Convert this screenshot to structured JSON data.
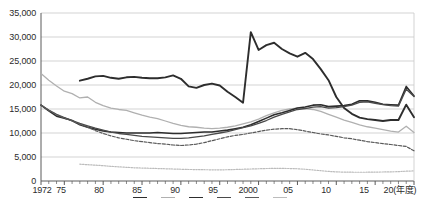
{
  "chart_data": {
    "type": "line",
    "title": "",
    "xlabel": "(年度)",
    "ylabel": "",
    "ylim": [
      0,
      35000
    ],
    "xlim": [
      1972,
      2020
    ],
    "grid": true,
    "legend_position": "bottom",
    "y_ticks": [
      "0",
      "5,000",
      "10,000",
      "15,000",
      "20,000",
      "25,000",
      "30,000",
      "35,000"
    ],
    "y_tick_values": [
      0,
      5000,
      10000,
      15000,
      20000,
      25000,
      30000,
      35000
    ],
    "x_ticks": [
      "1972",
      "75",
      "80",
      "85",
      "90",
      "95",
      "2000",
      "05",
      "10",
      "15",
      "20"
    ],
    "x_tick_values": [
      1972,
      1975,
      1980,
      1985,
      1990,
      1995,
      2000,
      2005,
      2010,
      2015,
      2020
    ],
    "x_axis_unit_label": "(年度)",
    "series": [
      {
        "name": "series-thick-dark",
        "color": "#2d2d2d",
        "style": "solid",
        "width": 1.9,
        "x": [
          1977,
          1978,
          1979,
          1980,
          1981,
          1982,
          1983,
          1984,
          1985,
          1986,
          1987,
          1988,
          1989,
          1990,
          1991,
          1992,
          1993,
          1994,
          1995,
          1996,
          1997,
          1998,
          1999,
          2000,
          2001,
          2002,
          2003,
          2004,
          2005,
          2006,
          2007,
          2008,
          2009,
          2010,
          2011,
          2012,
          2013,
          2014,
          2015,
          2016,
          2017,
          2018,
          2019,
          2020
        ],
        "values": [
          20900,
          21300,
          21800,
          21900,
          21500,
          21300,
          21600,
          21700,
          21500,
          21400,
          21400,
          21600,
          22000,
          21300,
          19700,
          19400,
          20000,
          20300,
          19900,
          18600,
          17500,
          16300,
          31000,
          27300,
          28300,
          28800,
          27500,
          26600,
          25900,
          26700,
          25400,
          23300,
          21000,
          17500,
          15200,
          14000,
          13200,
          12900,
          12700,
          12500,
          12700,
          12700,
          15900,
          13300
        ]
      },
      {
        "name": "series-light-gray",
        "color": "#b0b0b0",
        "style": "solid",
        "width": 1.3,
        "x": [
          1972,
          1973,
          1974,
          1975,
          1976,
          1977,
          1978,
          1979,
          1980,
          1981,
          1982,
          1983,
          1984,
          1985,
          1986,
          1987,
          1988,
          1989,
          1990,
          1991,
          1992,
          1993,
          1994,
          1995,
          1996,
          1997,
          1998,
          1999,
          2000,
          2001,
          2002,
          2003,
          2004,
          2005,
          2006,
          2007,
          2008,
          2009,
          2010,
          2011,
          2012,
          2013,
          2014,
          2015,
          2016,
          2017,
          2018,
          2019,
          2020
        ],
        "values": [
          22400,
          21000,
          19800,
          18700,
          18200,
          17300,
          17500,
          16400,
          15700,
          15200,
          14900,
          14700,
          14200,
          13700,
          13300,
          13000,
          12500,
          12000,
          11600,
          11300,
          11200,
          11000,
          10900,
          11000,
          11200,
          11500,
          11900,
          12300,
          12900,
          13600,
          14200,
          14700,
          15000,
          15200,
          15100,
          14900,
          14500,
          13900,
          13300,
          12700,
          12200,
          11700,
          11300,
          11000,
          10700,
          10400,
          10200,
          11400,
          10100
        ]
      },
      {
        "name": "series-dark-solid-a",
        "color": "#2d2d2d",
        "style": "solid",
        "width": 1.6,
        "x": [
          1972,
          1973,
          1974,
          1975,
          1976,
          1977,
          1978,
          1979,
          1980,
          1981,
          1982,
          1983,
          1984,
          1985,
          1986,
          1987,
          1988,
          1989,
          1990,
          1991,
          1992,
          1993,
          1994,
          1995,
          1996,
          1997,
          1998,
          1999,
          2000,
          2001,
          2002,
          2003,
          2004,
          2005,
          2006,
          2007,
          2008,
          2009,
          2010,
          2011,
          2012,
          2013,
          2014,
          2015,
          2016,
          2017,
          2018,
          2019,
          2020
        ],
        "values": [
          15800,
          14600,
          13500,
          13100,
          12600,
          11700,
          11200,
          10800,
          10400,
          10200,
          10100,
          10000,
          10000,
          10000,
          10000,
          10100,
          10000,
          9900,
          9900,
          10000,
          10100,
          10200,
          10200,
          10400,
          10600,
          10900,
          11200,
          11700,
          12400,
          13100,
          13800,
          14200,
          14700,
          15200,
          15400,
          15800,
          15900,
          15500,
          15600,
          15700,
          16000,
          16700,
          16700,
          16400,
          16000,
          15900,
          15800,
          19700,
          17700
        ]
      },
      {
        "name": "series-dark-solid-b",
        "color": "#4a4a4a",
        "style": "solid",
        "width": 1.3,
        "x": [
          1972,
          1973,
          1974,
          1975,
          1976,
          1977,
          1978,
          1979,
          1980,
          1981,
          1982,
          1983,
          1984,
          1985,
          1986,
          1987,
          1988,
          1989,
          1990,
          1991,
          1992,
          1993,
          1994,
          1995,
          1996,
          1997,
          1998,
          1999,
          2000,
          2001,
          2002,
          2003,
          2004,
          2005,
          2006,
          2007,
          2008,
          2009,
          2010,
          2011,
          2012,
          2013,
          2014,
          2015,
          2016,
          2017,
          2018,
          2019,
          2020
        ],
        "values": [
          15800,
          14800,
          13900,
          13200,
          12600,
          12000,
          11500,
          11000,
          10600,
          10200,
          9900,
          9700,
          9500,
          9300,
          9200,
          9100,
          9000,
          8900,
          8900,
          9000,
          9200,
          9400,
          9700,
          10000,
          10300,
          10700,
          11100,
          11500,
          12000,
          12600,
          13300,
          13900,
          14400,
          14900,
          15100,
          15400,
          15500,
          15200,
          15300,
          15500,
          15800,
          16400,
          16500,
          16200,
          15900,
          15700,
          15600,
          19100,
          17600
        ]
      },
      {
        "name": "series-dark-dashed",
        "color": "#5a5a5a",
        "style": "dashed",
        "width": 1.2,
        "x": [
          1972,
          1973,
          1974,
          1975,
          1976,
          1977,
          1978,
          1979,
          1980,
          1981,
          1982,
          1983,
          1984,
          1985,
          1986,
          1987,
          1988,
          1989,
          1990,
          1991,
          1992,
          1993,
          1994,
          1995,
          1996,
          1997,
          1998,
          1999,
          2000,
          2001,
          2002,
          2003,
          2004,
          2005,
          2006,
          2007,
          2008,
          2009,
          2010,
          2011,
          2012,
          2013,
          2014,
          2015,
          2016,
          2017,
          2018,
          2019,
          2020
        ],
        "values": [
          15800,
          14700,
          13800,
          13100,
          12500,
          11800,
          11200,
          10500,
          9900,
          9400,
          9000,
          8700,
          8400,
          8200,
          8000,
          7800,
          7700,
          7500,
          7400,
          7500,
          7700,
          8000,
          8400,
          8800,
          9200,
          9500,
          9700,
          10000,
          10300,
          10600,
          10800,
          10900,
          10900,
          10700,
          10400,
          10100,
          9800,
          9600,
          9300,
          9000,
          8800,
          8500,
          8200,
          8000,
          7800,
          7600,
          7400,
          7200,
          6300
        ]
      },
      {
        "name": "series-light-dotted",
        "color": "#bcbcbc",
        "style": "dotted",
        "width": 1.2,
        "x": [
          1977,
          1978,
          1979,
          1980,
          1981,
          1982,
          1983,
          1984,
          1985,
          1986,
          1987,
          1988,
          1989,
          1990,
          1991,
          1992,
          1993,
          1994,
          1995,
          1996,
          1997,
          1998,
          1999,
          2000,
          2001,
          2002,
          2003,
          2004,
          2005,
          2006,
          2007,
          2008,
          2009,
          2010,
          2011,
          2012,
          2013,
          2014,
          2015,
          2016,
          2017,
          2018,
          2019,
          2020
        ],
        "values": [
          3500,
          3400,
          3300,
          3200,
          3050,
          2950,
          2850,
          2750,
          2700,
          2650,
          2600,
          2550,
          2500,
          2450,
          2400,
          2380,
          2350,
          2330,
          2320,
          2350,
          2400,
          2450,
          2500,
          2550,
          2600,
          2620,
          2620,
          2600,
          2550,
          2450,
          2300,
          2150,
          2000,
          1900,
          1850,
          1830,
          1820,
          1830,
          1850,
          1880,
          1900,
          1950,
          2050,
          2100
        ]
      }
    ]
  },
  "axes": {
    "y_label_0": "0",
    "y_label_5000": "5,000",
    "y_label_10000": "10,000",
    "y_label_15000": "15,000",
    "y_label_20000": "20,000",
    "y_label_25000": "25,000",
    "y_label_30000": "30,000",
    "y_label_35000": "35,000",
    "x_label_1972": "1972",
    "x_label_1975": "75",
    "x_label_1980": "80",
    "x_label_1985": "85",
    "x_label_1990": "90",
    "x_label_1995": "95",
    "x_label_2000": "2000",
    "x_label_2005": "05",
    "x_label_2010": "10",
    "x_label_2015": "15",
    "x_label_2020": "20(年度)"
  },
  "legend": {
    "entries": [
      {
        "label": "",
        "color": "#2d2d2d"
      },
      {
        "label": "",
        "color": "#b0b0b0"
      },
      {
        "label": "",
        "color": "#2d2d2d"
      },
      {
        "label": "",
        "color": "#4a4a4a"
      },
      {
        "label": "",
        "color": "#5a5a5a"
      },
      {
        "label": "",
        "color": "#bcbcbc"
      }
    ]
  },
  "colors": {
    "grid": "#c8c8c8",
    "axis": "#5a5a5a",
    "text": "#2b2b2b",
    "background": "#ffffff"
  }
}
